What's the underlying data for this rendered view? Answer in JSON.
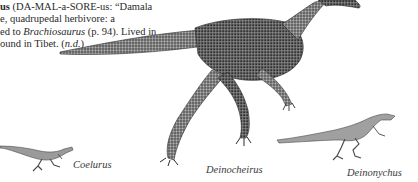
{
  "entry": {
    "headword_fragment": "us",
    "pronunciation_open": " (DA-MAL-a-SORE-us: “Damala",
    "line2": "e, quadrupedal herbivore: a",
    "line3_pre": "ed to ",
    "line3_italic": "Brachiosaurus",
    "line3_post": " (p. 94). Lived in",
    "line4_pre": "ound in Tibet. (",
    "line4_italic": "n.d.",
    "line4_post": ")"
  },
  "captions": {
    "coelurus": "Coelurus",
    "deinocheirus": "Deinocheirus",
    "deinonychus": "Deinonychus"
  },
  "illustrations": [
    {
      "name": "Deinocheirus",
      "style": "stippled engraving",
      "color": "#555555"
    },
    {
      "name": "Coelurus",
      "style": "line drawing",
      "color": "#6a6a6a"
    },
    {
      "name": "Deinonychus",
      "style": "line drawing",
      "color": "#6a6a6a"
    }
  ]
}
